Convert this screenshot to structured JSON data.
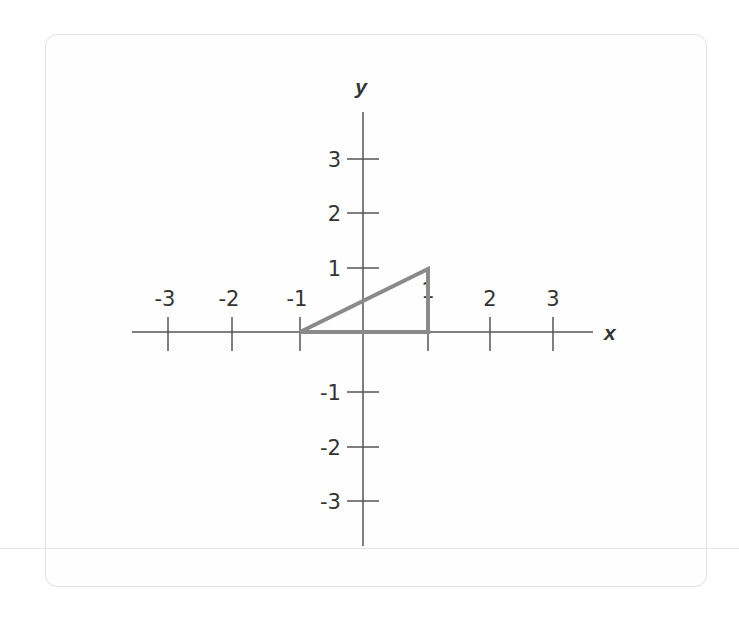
{
  "chart_data": {
    "type": "diagram",
    "title": "",
    "xlabel": "x",
    "ylabel": "y",
    "xlim": [
      -3,
      3
    ],
    "ylim": [
      -3,
      3
    ],
    "x_ticks": [
      "-3",
      "-2",
      "-1",
      "1",
      "2",
      "3"
    ],
    "y_ticks": [
      "3",
      "2",
      "1",
      "-1",
      "-2",
      "-3"
    ],
    "grid": false,
    "shapes": [
      {
        "kind": "triangle",
        "vertices": [
          [
            -1,
            0
          ],
          [
            1,
            0
          ],
          [
            1,
            1
          ]
        ],
        "stroke": "#8a8a8a"
      }
    ]
  },
  "axes": {
    "x_label": "x",
    "y_label": "y",
    "axis_color": "#555555",
    "shape_color": "#8a8a8a",
    "x_ticks": [
      {
        "label": "-3",
        "px": 168
      },
      {
        "label": "-2",
        "px": 232
      },
      {
        "label": "-1",
        "px": 300
      },
      {
        "label": "1",
        "px": 428
      },
      {
        "label": "2",
        "px": 490
      },
      {
        "label": "3",
        "px": 553
      }
    ],
    "y_ticks": [
      {
        "label": "3",
        "py": 159
      },
      {
        "label": "2",
        "py": 213
      },
      {
        "label": "1",
        "py": 268
      },
      {
        "label": "-1",
        "py": 392
      },
      {
        "label": "-2",
        "py": 447
      },
      {
        "label": "-3",
        "py": 501
      }
    ]
  }
}
